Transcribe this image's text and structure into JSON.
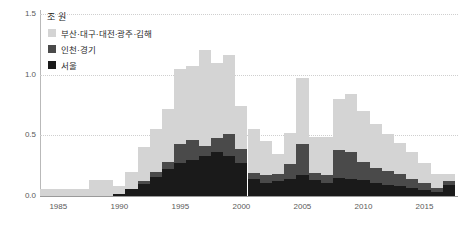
{
  "chart_data": {
    "type": "bar",
    "stacked": true,
    "title": "",
    "subtitle": "",
    "unit_label": "조 원",
    "xlabel": "",
    "ylabel": "",
    "ylim": [
      0.0,
      1.5
    ],
    "yticks": [
      "0.0",
      "0.5",
      "1.0",
      "1.5"
    ],
    "ytick_values": [
      0.0,
      0.5,
      1.0,
      1.5
    ],
    "xticks": [
      "1985",
      "1990",
      "1995",
      "2000",
      "2005",
      "2010",
      "2015"
    ],
    "xtick_values": [
      1985,
      1990,
      1995,
      2000,
      2005,
      2010,
      2015
    ],
    "grid": true,
    "legend_position": "top-left",
    "categories": [
      1984,
      1985,
      1986,
      1987,
      1988,
      1989,
      1990,
      1991,
      1992,
      1993,
      1994,
      1995,
      1996,
      1997,
      1998,
      1999,
      2000,
      2001,
      2002,
      2003,
      2004,
      2005,
      2006,
      2007,
      2008,
      2009,
      2010,
      2011,
      2012,
      2013,
      2014,
      2015,
      2016,
      2017
    ],
    "series": [
      {
        "name": "서울",
        "color": "#1a1a1a",
        "values": [
          0.0,
          0.0,
          0.0,
          0.0,
          0.0,
          0.0,
          0.02,
          0.06,
          0.1,
          0.16,
          0.22,
          0.27,
          0.3,
          0.33,
          0.36,
          0.33,
          0.27,
          0.14,
          0.11,
          0.12,
          0.14,
          0.17,
          0.13,
          0.11,
          0.15,
          0.14,
          0.13,
          0.11,
          0.09,
          0.08,
          0.07,
          0.05,
          0.03,
          0.09
        ]
      },
      {
        "name": "인천·경기",
        "color": "#4a4a4a",
        "values": [
          0.0,
          0.0,
          0.0,
          0.0,
          0.0,
          0.0,
          0.0,
          0.0,
          0.02,
          0.04,
          0.06,
          0.16,
          0.16,
          0.08,
          0.12,
          0.18,
          0.12,
          0.05,
          0.06,
          0.06,
          0.12,
          0.26,
          0.06,
          0.06,
          0.23,
          0.22,
          0.15,
          0.12,
          0.12,
          0.1,
          0.07,
          0.06,
          0.04,
          0.03
        ]
      },
      {
        "name": "부산·대구·대전·광주·김해",
        "color": "#d4d4d4",
        "values": [
          0.06,
          0.06,
          0.06,
          0.06,
          0.13,
          0.13,
          0.06,
          0.14,
          0.28,
          0.35,
          0.44,
          0.62,
          0.61,
          0.79,
          0.62,
          0.65,
          0.35,
          0.36,
          0.28,
          0.17,
          0.26,
          0.54,
          0.3,
          0.32,
          0.42,
          0.48,
          0.42,
          0.36,
          0.3,
          0.26,
          0.22,
          0.16,
          0.11,
          0.06
        ]
      }
    ],
    "colors": {
      "series_light": "#d4d4d4",
      "series_mid": "#4a4a4a",
      "series_dark": "#1a1a1a",
      "grid": "#cfcfcf",
      "axis": "#9a9a9a",
      "text": "#5a5a5a"
    }
  },
  "legend": {
    "items": [
      {
        "label": "부산·대구·대전·광주·김해",
        "color": "#d4d4d4"
      },
      {
        "label": "인천·경기",
        "color": "#4a4a4a"
      },
      {
        "label": "서울",
        "color": "#1a1a1a"
      }
    ]
  }
}
